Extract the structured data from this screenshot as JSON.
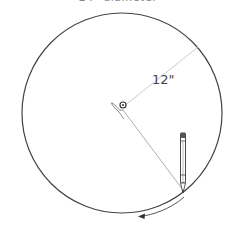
{
  "caption": "24\" diameter",
  "diagram": {
    "radius_label": "12\"",
    "circle": {
      "cx": 122,
      "cy": 113,
      "r": 100,
      "stroke": "#444444"
    },
    "center_pin": {
      "x": 123,
      "y": 107
    },
    "radius_line_end": {
      "x": 198,
      "y": 47
    },
    "string_end": {
      "x": 183,
      "y": 190
    },
    "pencil": {
      "top": 132,
      "bottom": 196,
      "x": 183
    },
    "arrow_direction": "counterclockwise"
  }
}
